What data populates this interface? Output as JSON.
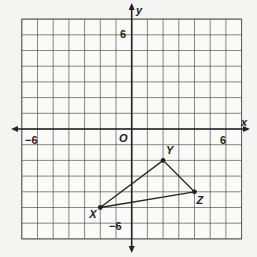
{
  "graph": {
    "origin_px": [
      131.7,
      129
    ],
    "unit_px": 15.7,
    "grid_range": {
      "xmin": -7,
      "xmax": 7,
      "ymin": -7,
      "ymax": 7
    },
    "axes": {
      "x_label": "x",
      "y_label": "y",
      "origin_label": "O"
    },
    "tick_labels": {
      "x_neg": "−6",
      "x_pos": "6",
      "y_pos": "6",
      "y_neg": "−6"
    },
    "colors": {
      "background": "#f4f4f2",
      "grid": "#555555",
      "axis": "#222222",
      "triangle": "#222222"
    }
  },
  "triangle": {
    "vertices": [
      {
        "name": "X",
        "x": -2,
        "y": -5
      },
      {
        "name": "Y",
        "x": 2,
        "y": -2
      },
      {
        "name": "Z",
        "x": 4,
        "y": -4
      }
    ]
  },
  "chart_data": {
    "type": "scatter",
    "title": "",
    "xlabel": "x",
    "ylabel": "y",
    "xlim": [
      -7,
      7
    ],
    "ylim": [
      -7,
      7
    ],
    "grid": true,
    "series": [
      {
        "name": "Triangle XYZ",
        "points": [
          {
            "label": "X",
            "x": -2,
            "y": -5
          },
          {
            "label": "Y",
            "x": 2,
            "y": -2
          },
          {
            "label": "Z",
            "x": 4,
            "y": -4
          }
        ],
        "closed": true
      }
    ],
    "tick_labels": {
      "x": [
        "-6",
        "6"
      ],
      "y": [
        "6",
        "-6"
      ]
    },
    "annotations": [
      "O"
    ]
  }
}
